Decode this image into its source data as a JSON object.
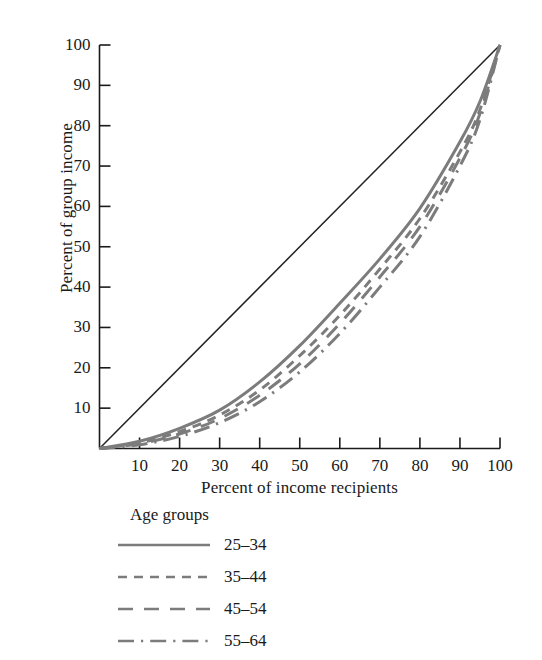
{
  "chart_data": {
    "type": "line",
    "title": "",
    "xlabel": "Percent of income recipients",
    "ylabel": "Percent of group income",
    "xlim": [
      0,
      100
    ],
    "ylim": [
      0,
      100
    ],
    "grid": false,
    "legend_position": "below-plot",
    "legend_title": "Age groups",
    "xticks": [
      10,
      20,
      30,
      40,
      50,
      60,
      70,
      80,
      90,
      100
    ],
    "yticks": [
      10,
      20,
      30,
      40,
      50,
      60,
      70,
      80,
      90,
      100
    ],
    "xtick_labels": [
      "10",
      "20",
      "30",
      "40",
      "50",
      "60",
      "70",
      "80",
      "90",
      "100"
    ],
    "ytick_labels": [
      "10",
      "20",
      "30",
      "40",
      "50",
      "60",
      "70",
      "80",
      "90",
      "100"
    ],
    "x": [
      0,
      10,
      20,
      30,
      40,
      50,
      60,
      70,
      80,
      90,
      95,
      100
    ],
    "reference_line": {
      "name": "line of equality",
      "x": [
        0,
        100
      ],
      "values": [
        0,
        100
      ],
      "color": "#222222",
      "style": "solid"
    },
    "series": [
      {
        "name": "25-34",
        "label": "25–34",
        "style": "solid",
        "color": "#7c7c7c",
        "values": [
          0,
          1.8,
          5.0,
          9.5,
          16.5,
          25.5,
          36.0,
          47.0,
          59.5,
          76.0,
          86.0,
          100
        ]
      },
      {
        "name": "35-44",
        "label": "35–44",
        "style": "dashed-short",
        "color": "#7c7c7c",
        "values": [
          0,
          1.4,
          4.2,
          8.3,
          14.5,
          23.0,
          33.0,
          44.5,
          57.0,
          73.5,
          84.0,
          100
        ]
      },
      {
        "name": "45-54",
        "label": "45–54",
        "style": "dashed-long",
        "color": "#7c7c7c",
        "values": [
          0,
          1.2,
          3.6,
          7.4,
          13.2,
          21.0,
          31.0,
          42.5,
          55.0,
          72.0,
          83.0,
          100
        ]
      },
      {
        "name": "55-64",
        "label": "55–64",
        "style": "dash-dot",
        "color": "#7c7c7c",
        "values": [
          0,
          0.9,
          3.0,
          6.4,
          11.6,
          19.0,
          28.5,
          40.0,
          52.5,
          70.0,
          81.5,
          100
        ]
      }
    ]
  },
  "axes": {
    "y_title": "Percent of group income",
    "x_title": "Percent of income recipients"
  },
  "legend": {
    "title": "Age groups",
    "items": [
      {
        "label": "25–34"
      },
      {
        "label": "35–44"
      },
      {
        "label": "45–54"
      },
      {
        "label": "55–64"
      }
    ]
  }
}
